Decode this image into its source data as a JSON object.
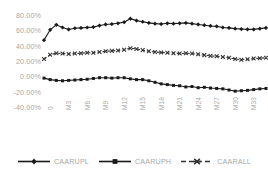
{
  "chart_data": {
    "type": "line",
    "title": "",
    "xlabel": "",
    "ylabel": "",
    "ylim": [
      -40,
      80
    ],
    "grid": false,
    "legend_position": "bottom",
    "ytick_labels": [
      "80.00%",
      "60.00%",
      "40.00%",
      "20.00%",
      "0.00%",
      "-20.00%",
      "-40.00%"
    ],
    "ytick_values": [
      80,
      60,
      40,
      20,
      0,
      -20,
      -40
    ],
    "xtick_labels": [
      "0",
      "M3",
      "M6",
      "M9",
      "M12",
      "M15",
      "M18",
      "M21",
      "M24",
      "M27",
      "M30",
      "M33",
      "M36"
    ],
    "xtick_indices": [
      0,
      3,
      6,
      9,
      12,
      15,
      18,
      21,
      24,
      27,
      30,
      33,
      36
    ],
    "x": [
      0,
      1,
      2,
      3,
      4,
      5,
      6,
      7,
      8,
      9,
      10,
      11,
      12,
      13,
      14,
      15,
      16,
      17,
      18,
      19,
      20,
      21,
      22,
      23,
      24,
      25,
      26,
      27,
      28,
      29,
      30,
      31,
      32,
      33,
      34,
      35,
      36
    ],
    "series": [
      {
        "name": "CAARUPL",
        "color": "#1a1a1a",
        "marker": "diamond",
        "dash": "solid",
        "values": [
          48.5,
          62.0,
          68.5,
          65.0,
          62.5,
          64.0,
          64.5,
          65.0,
          65.5,
          67.5,
          69.0,
          69.5,
          70.5,
          72.0,
          76.5,
          74.0,
          72.5,
          71.0,
          70.0,
          69.5,
          70.5,
          70.0,
          70.5,
          71.0,
          70.0,
          69.0,
          68.0,
          67.0,
          66.5,
          65.0,
          64.5,
          63.5,
          63.0,
          62.5,
          62.5,
          63.5,
          64.5
        ]
      },
      {
        "name": "CAARUPH",
        "color": "#1a1a1a",
        "marker": "square",
        "dash": "solid",
        "values": [
          -1.0,
          -3.0,
          -4.0,
          -4.5,
          -4.0,
          -3.5,
          -3.0,
          -2.5,
          -1.5,
          -0.5,
          -0.5,
          -1.0,
          -0.5,
          -0.5,
          -2.0,
          -3.0,
          -3.0,
          -4.5,
          -6.5,
          -8.5,
          -9.5,
          -10.5,
          -11.0,
          -12.5,
          -12.0,
          -13.5,
          -13.0,
          -14.0,
          -14.5,
          -15.0,
          -16.5,
          -18.0,
          -17.5,
          -17.0,
          -16.0,
          -15.0,
          -14.5
        ]
      },
      {
        "name": "CAARALL",
        "color": "#333333",
        "marker": "x",
        "dash": "dashed",
        "values": [
          24.0,
          29.5,
          31.5,
          31.0,
          30.5,
          31.0,
          31.5,
          32.0,
          32.0,
          33.0,
          34.0,
          34.5,
          35.0,
          36.0,
          38.0,
          37.0,
          35.5,
          34.0,
          33.0,
          32.5,
          32.0,
          31.5,
          31.0,
          31.5,
          31.0,
          30.0,
          29.0,
          28.0,
          27.5,
          26.5,
          25.5,
          24.0,
          23.0,
          23.5,
          24.5,
          25.0,
          25.5
        ]
      }
    ]
  },
  "legend": {
    "items": [
      {
        "label": "CAARUPL"
      },
      {
        "label": "CAARUPH"
      },
      {
        "label": "CAARALL"
      }
    ]
  }
}
